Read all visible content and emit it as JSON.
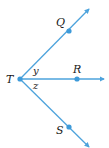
{
  "diagram": {
    "type": "rays-from-common-vertex",
    "colors": {
      "ray": "#4da3dc",
      "point": "#3d9ad9",
      "text": "#1a1a1a"
    },
    "vertex": {
      "label": "T"
    },
    "points": [
      {
        "label": "Q"
      },
      {
        "label": "R"
      },
      {
        "label": "S"
      }
    ],
    "rays": [
      {
        "name": "ray TQ"
      },
      {
        "name": "ray TR"
      },
      {
        "name": "ray TS"
      }
    ],
    "angles": [
      {
        "label": "y",
        "between": "QTR"
      },
      {
        "label": "z",
        "between": "RTS"
      }
    ]
  }
}
